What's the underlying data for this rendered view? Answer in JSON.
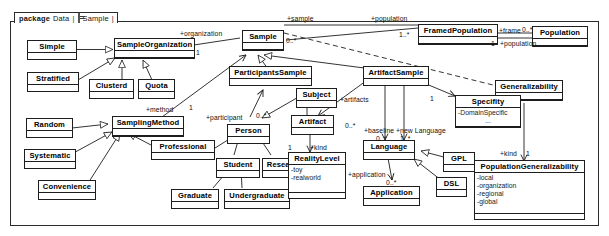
{
  "diagram": {
    "kind": "uml-class-diagram",
    "package": {
      "keyword": "package",
      "path_root": "Data",
      "sep1": "|",
      "icon": "package-icon",
      "path_leaf": "Sample",
      "sep2": "|"
    },
    "classes": [
      {
        "id": "simple",
        "name": "Simple",
        "attrs": []
      },
      {
        "id": "sampleorg",
        "name": "SampleOrganization",
        "attrs": []
      },
      {
        "id": "stratified",
        "name": "Stratified",
        "attrs": []
      },
      {
        "id": "clusterd",
        "name": "Clusterd",
        "attrs": []
      },
      {
        "id": "quota",
        "name": "Quota",
        "attrs": []
      },
      {
        "id": "random",
        "name": "Random",
        "attrs": []
      },
      {
        "id": "samplingmethod",
        "name": "SamplingMethod",
        "attrs": []
      },
      {
        "id": "systematic",
        "name": "Systematic",
        "attrs": []
      },
      {
        "id": "convenience",
        "name": "Convenience",
        "attrs": []
      },
      {
        "id": "professional",
        "name": "Professional",
        "attrs": []
      },
      {
        "id": "person",
        "name": "Person",
        "attrs": []
      },
      {
        "id": "student",
        "name": "Student",
        "attrs": []
      },
      {
        "id": "researcher",
        "name": "Researcher",
        "attrs": []
      },
      {
        "id": "graduate",
        "name": "Graduate",
        "attrs": []
      },
      {
        "id": "undergraduate",
        "name": "Undergraduate",
        "attrs": []
      },
      {
        "id": "sample",
        "name": "Sample",
        "attrs": []
      },
      {
        "id": "participantssample",
        "name": "ParticipantsSample",
        "attrs": []
      },
      {
        "id": "artifactsample",
        "name": "ArtifactSample",
        "attrs": []
      },
      {
        "id": "subject",
        "name": "Subject",
        "attrs": []
      },
      {
        "id": "artifact",
        "name": "Artifact",
        "attrs": []
      },
      {
        "id": "realitylevel",
        "name": "RealityLevel",
        "attrs": [
          "-toy",
          "-realworld"
        ]
      },
      {
        "id": "language",
        "name": "Language",
        "attrs": []
      },
      {
        "id": "application",
        "name": "Application",
        "attrs": []
      },
      {
        "id": "gpl",
        "name": "GPL",
        "attrs": []
      },
      {
        "id": "dsl",
        "name": "DSL",
        "attrs": []
      },
      {
        "id": "framedpopulation",
        "name": "FramedPopulation",
        "attrs": []
      },
      {
        "id": "population",
        "name": "Population",
        "attrs": []
      },
      {
        "id": "generalizability",
        "name": "Generalizability",
        "attrs": []
      },
      {
        "id": "specifity",
        "name": "Specifity",
        "attrs": [
          "-DomainSpecific",
          "..."
        ]
      },
      {
        "id": "popgeneralizability",
        "name": "PopulationGeneralizability",
        "attrs": [
          "-local",
          "-organization",
          "-regional",
          "-global"
        ]
      }
    ],
    "edge_labels": [
      {
        "id": "l-organization",
        "text": "+organization"
      },
      {
        "id": "l-org-mult",
        "text": "1"
      },
      {
        "id": "l-sample",
        "text": "+sample"
      },
      {
        "id": "l-sample-mult",
        "text": "0..*"
      },
      {
        "id": "l-population",
        "text": "+population"
      },
      {
        "id": "l-pop-mult",
        "text": "1..*"
      },
      {
        "id": "l-frame",
        "text": "+frame"
      },
      {
        "id": "l-frame-mult",
        "text": "0..*"
      },
      {
        "id": "l-population2",
        "text": "+population"
      },
      {
        "id": "l-pop2-mult",
        "text": "1"
      },
      {
        "id": "l-method",
        "text": "+method"
      },
      {
        "id": "l-method-mult",
        "text": "1"
      },
      {
        "id": "l-participant",
        "text": "+participant"
      },
      {
        "id": "l-part-mult",
        "text": "0..*"
      },
      {
        "id": "l-artifacts",
        "text": "+artifacts"
      },
      {
        "id": "l-artifacts-mult",
        "text": "0..*"
      },
      {
        "id": "l-baseline",
        "text": "+baseline"
      },
      {
        "id": "l-baseline-mult",
        "text": "0..*"
      },
      {
        "id": "l-newlanguage",
        "text": "+new Language"
      },
      {
        "id": "l-newlang-mult",
        "text": "1..*"
      },
      {
        "id": "l-application",
        "text": "+application"
      },
      {
        "id": "l-app-mult",
        "text": "0..*"
      },
      {
        "id": "l-kind-artifact",
        "text": "+kind"
      },
      {
        "id": "l-kind-art-mult",
        "text": "1"
      },
      {
        "id": "l-specifity-mult",
        "text": "1"
      },
      {
        "id": "l-kind-pop",
        "text": "+kind"
      },
      {
        "id": "l-kind-pop-mult",
        "text": "1"
      }
    ],
    "colors": {
      "stroke": "#1d1d1d",
      "fill": "#ffffff",
      "text": "#000000",
      "frame": "#2b2b2b"
    }
  }
}
